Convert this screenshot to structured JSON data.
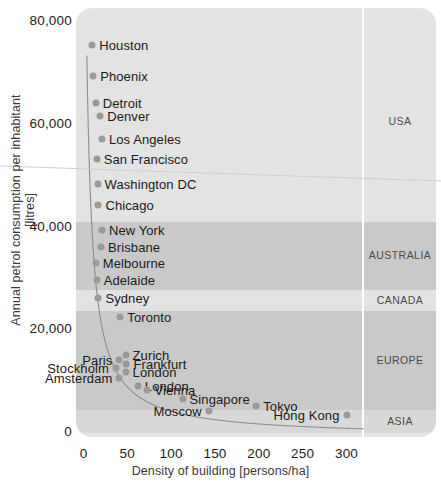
{
  "chart_data": {
    "type": "scatter",
    "title": "",
    "xlabel": "Density of building [persons/ha]",
    "ylabel": "Annual petrol consumption per inhabitant  [litres]",
    "xlim": [
      0,
      330
    ],
    "ylim": [
      0,
      80000
    ],
    "xticks": [
      0,
      50,
      100,
      150,
      200,
      250,
      300
    ],
    "xtick_labels": [
      "0",
      "50",
      "100",
      "150",
      "200",
      "250",
      "300"
    ],
    "yticks": [
      0,
      20000,
      40000,
      60000,
      80000
    ],
    "ytick_labels": [
      "0",
      "20,000",
      "40,000",
      "60,000",
      "80,000"
    ],
    "grid": false,
    "legend_position": "right-panel",
    "has_trend_curve": true,
    "trend_curve_note": "hyperbolic decay fit through the cloud",
    "points": [
      {
        "label": "Houston",
        "x": 10,
        "y": 75500,
        "region": "USA",
        "label_side": "right"
      },
      {
        "label": "Phoenix",
        "x": 11,
        "y": 69500,
        "region": "USA",
        "label_side": "right"
      },
      {
        "label": "Detroit",
        "x": 14,
        "y": 64200,
        "region": "USA",
        "label_side": "right"
      },
      {
        "label": "Denver",
        "x": 19,
        "y": 61800,
        "region": "USA",
        "label_side": "right"
      },
      {
        "label": "Los Angeles",
        "x": 21,
        "y": 57200,
        "region": "USA",
        "label_side": "right"
      },
      {
        "label": "San Francisco",
        "x": 15,
        "y": 53400,
        "region": "USA",
        "label_side": "right"
      },
      {
        "label": "Washington DC",
        "x": 16,
        "y": 48500,
        "region": "USA",
        "label_side": "right"
      },
      {
        "label": "Chicago",
        "x": 17,
        "y": 44300,
        "region": "USA",
        "label_side": "right"
      },
      {
        "label": "New York",
        "x": 21,
        "y": 39600,
        "region": "USA",
        "label_side": "right"
      },
      {
        "label": "Brisbane",
        "x": 20,
        "y": 36300,
        "region": "AUSTRALIA",
        "label_side": "right"
      },
      {
        "label": "Melbourne",
        "x": 14,
        "y": 33100,
        "region": "AUSTRALIA",
        "label_side": "right"
      },
      {
        "label": "Adelaide",
        "x": 15,
        "y": 29700,
        "region": "AUSTRALIA",
        "label_side": "right"
      },
      {
        "label": "Sydney",
        "x": 17,
        "y": 26300,
        "region": "AUSTRALIA",
        "label_side": "right"
      },
      {
        "label": "Toronto",
        "x": 42,
        "y": 22600,
        "region": "CANADA",
        "label_side": "right"
      },
      {
        "label": "Zurich",
        "x": 48,
        "y": 15100,
        "region": "EUROPE",
        "label_side": "right"
      },
      {
        "label": "Paris",
        "x": 41,
        "y": 14200,
        "region": "EUROPE",
        "label_side": "left"
      },
      {
        "label": "Frankfurt",
        "x": 49,
        "y": 13500,
        "region": "EUROPE",
        "label_side": "right"
      },
      {
        "label": "Stockholm",
        "x": 37,
        "y": 12600,
        "region": "EUROPE",
        "label_side": "left"
      },
      {
        "label": "London",
        "x": 48,
        "y": 11800,
        "region": "EUROPE",
        "label_side": "right"
      },
      {
        "label": "Amsterdam",
        "x": 41,
        "y": 10800,
        "region": "EUROPE",
        "label_side": "left"
      },
      {
        "label": "London",
        "x": 62,
        "y": 9200,
        "region": "EUROPE",
        "label_side": "right"
      },
      {
        "label": "Vienna",
        "x": 73,
        "y": 8300,
        "region": "EUROPE",
        "label_side": "right"
      },
      {
        "label": "Singapore",
        "x": 113,
        "y": 6700,
        "region": "ASIA",
        "label_side": "right"
      },
      {
        "label": "Moscow",
        "x": 143,
        "y": 4300,
        "region": "ASIA",
        "label_side": "left"
      },
      {
        "label": "Tokyo",
        "x": 197,
        "y": 5200,
        "region": "ASIA",
        "label_side": "right"
      },
      {
        "label": "Hong Kong",
        "x": 300,
        "y": 3600,
        "region": "ASIA",
        "label_side": "left"
      }
    ],
    "regions": [
      {
        "name": "USA",
        "y_top": 80000,
        "y_bottom": 41000,
        "shade": "#e3e3e3"
      },
      {
        "name": "AUSTRALIA",
        "y_top": 41000,
        "y_bottom": 27800,
        "shade": "#c9c9c9"
      },
      {
        "name": "CANADA",
        "y_top": 27800,
        "y_bottom": 23700,
        "shade": "#e3e3e3"
      },
      {
        "name": "EUROPE",
        "y_top": 23700,
        "y_bottom": 4400,
        "shade": "#c9c9c9"
      },
      {
        "name": "ASIA",
        "y_top": 4400,
        "y_bottom": 0,
        "shade": "#d8d8d8"
      }
    ],
    "colors": {
      "point": "#9a9a9a",
      "curve": "#8d8d8d",
      "panel_light": "#e3e3e3",
      "panel_dark": "#c9c9c9",
      "panel_asia": "#d8d8d8",
      "text": "#1a1a1a",
      "axis_text": "#3a3a3a",
      "separator": "#ffffff"
    }
  }
}
